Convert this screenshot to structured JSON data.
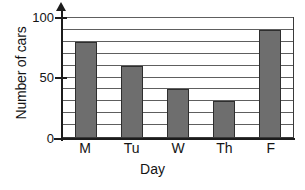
{
  "chart_data": {
    "type": "bar",
    "title": "",
    "xlabel": "Day",
    "ylabel": "Number of cars",
    "categories": [
      "M",
      "Tu",
      "W",
      "Th",
      "F"
    ],
    "values": [
      80,
      60,
      40,
      30,
      90
    ],
    "series": [
      {
        "name": "Number of cars",
        "values": [
          80,
          60,
          40,
          30,
          90
        ]
      }
    ],
    "ylim": [
      0,
      100
    ],
    "y_tick_labels": [
      "0",
      "50",
      "100"
    ],
    "y_tick_values": [
      0,
      50,
      100
    ],
    "gridline_values": [
      10,
      20,
      30,
      40,
      50,
      60,
      70,
      80,
      90,
      100
    ],
    "grid": true,
    "legend": false,
    "legend_position": "none",
    "bar_color": "#6e6e6e",
    "bar_edge_color": "#2e2e2e",
    "gridline_color": "#5e5e5e",
    "axis_color": "#1c1c1c",
    "background_color": "#ffffff"
  },
  "axes": {
    "y_title": "Number of cars",
    "x_title": "Day"
  }
}
